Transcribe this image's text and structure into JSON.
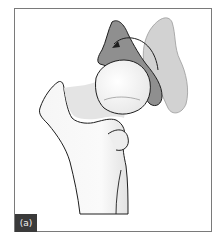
{
  "figure": {
    "panel_label": "(a)",
    "colors": {
      "frame_border": "#7a7a7a",
      "label_bg": "#3a3a3a",
      "label_text": "#f2f2f2",
      "bone_fill": "#f4f4f4",
      "shade_dark": "#8a8a8a",
      "shade_light": "#cfcfcf",
      "outline": "#1e1e1e"
    },
    "icons": {
      "rotation_arrow": "curved-arrow-counterclockwise"
    }
  }
}
